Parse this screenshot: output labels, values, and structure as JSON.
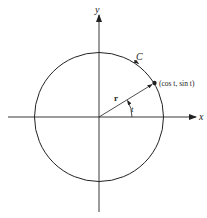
{
  "diagram": {
    "axes": {
      "x_label": "x",
      "y_label": "y"
    },
    "curve_label": "C",
    "vector_label": "r",
    "angle_label": "t",
    "point_label": "(cos t, sin t)",
    "colors": {
      "stroke": "#222222",
      "background": "#ffffff"
    }
  }
}
